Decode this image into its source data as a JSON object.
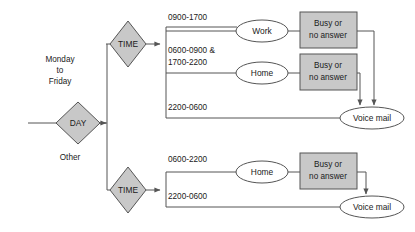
{
  "diagram": {
    "type": "flowchart",
    "nodes": [
      {
        "id": "day",
        "kind": "decision",
        "label": "DAY",
        "cx": 78,
        "cy": 123
      },
      {
        "id": "time-top",
        "kind": "decision",
        "label": "TIME",
        "cx": 128,
        "cy": 44
      },
      {
        "id": "time-bottom",
        "kind": "decision",
        "label": "TIME",
        "cx": 128,
        "cy": 190
      },
      {
        "id": "work",
        "kind": "terminal",
        "label": "Work",
        "cx": 262,
        "cy": 31
      },
      {
        "id": "home-top",
        "kind": "terminal",
        "label": "Home",
        "cx": 262,
        "cy": 73
      },
      {
        "id": "home-bottom",
        "kind": "terminal",
        "label": "Home",
        "cx": 262,
        "cy": 172
      },
      {
        "id": "busy-work",
        "kind": "process",
        "label_line1": "Busy or",
        "label_line2": "no answer",
        "cx": 328,
        "cy": 30
      },
      {
        "id": "busy-home",
        "kind": "process",
        "label_line1": "Busy or",
        "label_line2": "no answer",
        "cx": 328,
        "cy": 72
      },
      {
        "id": "busy-other",
        "kind": "process",
        "label_line1": "Busy or",
        "label_line2": "no answer",
        "cx": 328,
        "cy": 171
      },
      {
        "id": "voicemail-top",
        "kind": "terminal",
        "label": "Voice mail",
        "cx": 372,
        "cy": 118
      },
      {
        "id": "voicemail-bottom",
        "kind": "terminal",
        "label": "Voice mail",
        "cx": 372,
        "cy": 207
      }
    ],
    "edge_labels": [
      {
        "id": "day-weekday",
        "text_line1": "Monday",
        "text_line2": "to",
        "text_line3": "Friday",
        "x": 60,
        "y": 66
      },
      {
        "id": "day-other",
        "text_line1": "Other",
        "x": 70,
        "y": 160
      },
      {
        "id": "time-top-business",
        "text_line1": "0900-1700",
        "x": 168,
        "y": 18
      },
      {
        "id": "time-top-offhours",
        "text_line1": "0600-0900 &",
        "text_line2": "1700-2200",
        "x": 168,
        "y": 52
      },
      {
        "id": "time-top-night",
        "text_line1": "2200-0600",
        "x": 168,
        "y": 107
      },
      {
        "id": "time-bottom-day",
        "text_line1": "0600-2200",
        "x": 168,
        "y": 160
      },
      {
        "id": "time-bottom-night",
        "text_line1": "2200-0600",
        "x": 168,
        "y": 193
      }
    ],
    "colors": {
      "shape_gray": "#c8c8c8",
      "shape_white": "#ffffff",
      "stroke": "#555555",
      "text": "#1a1a1a",
      "background": "#ffffff"
    }
  }
}
